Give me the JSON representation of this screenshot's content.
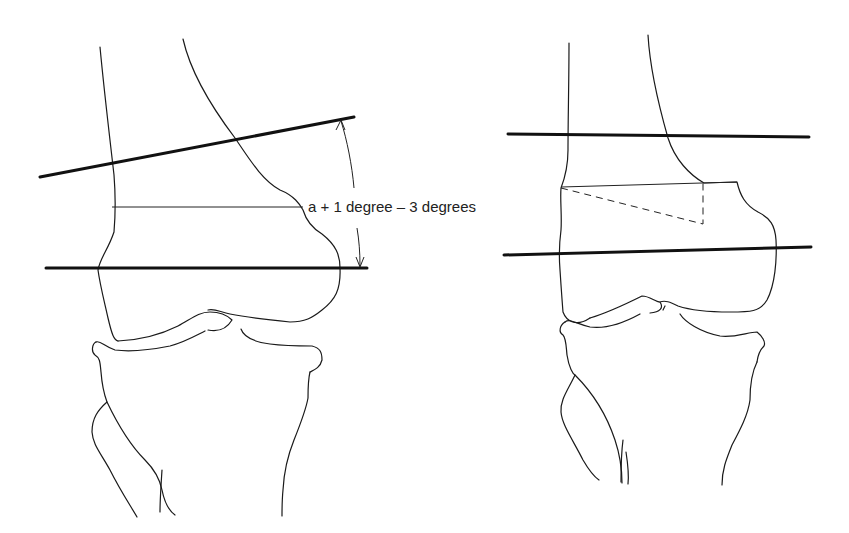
{
  "figure": {
    "panels": [
      {
        "id": "left",
        "description": "Knee, anteroposterior view with femoral axis line and joint line; angle measured between them",
        "annotation": "a + 1 degree – 3 degrees"
      },
      {
        "id": "right",
        "description": "Knee after distal femoral osteotomy; wedge (dashed triangle) removed, axis lines now parallel"
      }
    ],
    "colors": {
      "line": "#1a1a1a",
      "background": "#ffffff"
    }
  }
}
